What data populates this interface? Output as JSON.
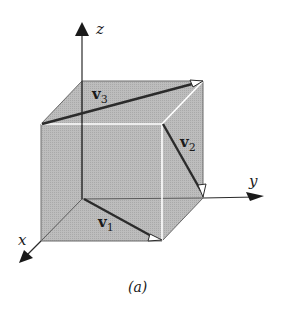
{
  "figure": {
    "caption": "(a)",
    "colors": {
      "cube_face": "#b9b9b9",
      "cube_edge_hidden": "#6e6e6e",
      "cube_edge_front": "#ffffff",
      "vector": "#2b2b2b",
      "axis": "#2b2b2b"
    },
    "axes": [
      {
        "name": "x",
        "label": "x"
      },
      {
        "name": "y",
        "label": "y"
      },
      {
        "name": "z",
        "label": "z"
      }
    ],
    "vectors": [
      {
        "name": "v1",
        "label": "v",
        "subscript": "1",
        "description": "from origin along bottom face diagonal to front-bottom-right corner"
      },
      {
        "name": "v2",
        "label": "v",
        "subscript": "2",
        "description": "from front-top-right corner down to back-bottom-right corner"
      },
      {
        "name": "v3",
        "label": "v",
        "subscript": "3",
        "description": "from front-top-left corner to back-top-right corner"
      }
    ],
    "object": "unit cube"
  }
}
